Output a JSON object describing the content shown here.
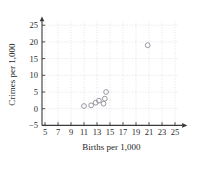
{
  "chart_data": {
    "type": "scatter",
    "title": "",
    "xlabel": "Births per 1,000",
    "ylabel": "Crimes per 1,000",
    "xlim": [
      4,
      26
    ],
    "ylim": [
      -6,
      27
    ],
    "xticks": [
      5,
      7,
      9,
      11,
      13,
      15,
      17,
      19,
      21,
      23,
      25
    ],
    "xtick_labels": [
      "5",
      "7",
      "9",
      "11",
      "13",
      "15",
      "17",
      "19",
      "21",
      "23",
      "25"
    ],
    "yticks": [
      -5,
      0,
      5,
      10,
      15,
      20,
      25
    ],
    "ytick_labels": [
      "−5",
      "0",
      "5",
      "10",
      "15",
      "20",
      "25"
    ],
    "grid": true,
    "legend": null,
    "marker": "open-circle",
    "marker_color": "#8c8c96",
    "points": [
      {
        "x": 11.0,
        "y": 0.8
      },
      {
        "x": 12.1,
        "y": 1.0
      },
      {
        "x": 12.8,
        "y": 1.8
      },
      {
        "x": 13.3,
        "y": 2.4
      },
      {
        "x": 14.0,
        "y": 1.5
      },
      {
        "x": 14.2,
        "y": 3.0
      },
      {
        "x": 14.4,
        "y": 5.0
      },
      {
        "x": 20.8,
        "y": 19.0
      }
    ]
  },
  "axes": {
    "x_title": "Births per 1,000",
    "y_title": "Crimes per 1,000"
  },
  "colors": {
    "axis": "#3a3a3a",
    "grid": "#c9c9d6",
    "marker": "#8c8c96",
    "text": "#2b2b2b",
    "background": "#ffffff"
  }
}
